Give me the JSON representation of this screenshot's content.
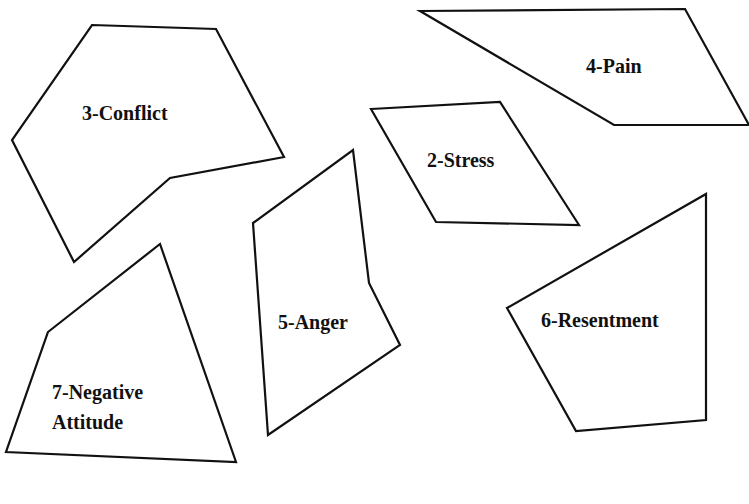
{
  "diagram": {
    "title": "",
    "colors": {
      "stroke": "#111111",
      "fill": "#ffffff",
      "background": "#ffffff"
    },
    "pieces": [
      {
        "id": "conflict",
        "label": "3-Conflict",
        "points": "92,25 216,29 284,157 170,178 74,262 12,140",
        "label_x": 82,
        "label_y": 120
      },
      {
        "id": "pain",
        "label": "4-Pain",
        "points": "420,11 685,9 749,125 614,125",
        "label_x": 586,
        "label_y": 73
      },
      {
        "id": "stress",
        "label": "2-Stress",
        "points": "371,109 500,102 579,225 436,222",
        "label_x": 427,
        "label_y": 167
      },
      {
        "id": "anger",
        "label": "5-Anger",
        "points": "253,223 353,150 369,283 400,345 268,435",
        "label_x": 278,
        "label_y": 329
      },
      {
        "id": "negative-attitude",
        "label": "7-Negative",
        "label2": "Attitude",
        "points": "48,332 160,244 236,462 6,452",
        "label_x": 52,
        "label_y": 399,
        "label2_y": 429
      },
      {
        "id": "resentment",
        "label": "6-Resentment",
        "points": "507,308 706,194 706,420 576,431",
        "label_x": 541,
        "label_y": 327
      }
    ]
  }
}
